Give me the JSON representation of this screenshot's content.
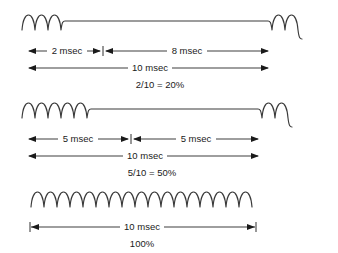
{
  "figure": {
    "background_color": "#ffffff",
    "wave_color": "#3a3a3a",
    "line_color": "#1a1a1a",
    "width": 338,
    "height": 253
  },
  "rows": [
    {
      "id": "row-20-percent",
      "on_label": "2 msec",
      "off_label": "8 msec",
      "total_label": "10 msec",
      "duty_label": "2/10 = 20%",
      "duty_fraction": "2/10",
      "duty_percent": "20%",
      "on_msec": 2,
      "off_msec": 8,
      "total_msec": 10,
      "cycles_on": 3
    },
    {
      "id": "row-50-percent",
      "on_label": "5 msec",
      "off_label": "5 msec",
      "total_label": "10 msec",
      "duty_label": "5/10 = 50%",
      "duty_fraction": "5/10",
      "duty_percent": "50%",
      "on_msec": 5,
      "off_msec": 5,
      "total_msec": 10,
      "cycles_on": 4
    },
    {
      "id": "row-100-percent",
      "on_label": "",
      "off_label": "",
      "total_label": "10 msec",
      "duty_label": "100%",
      "duty_fraction": "",
      "duty_percent": "100%",
      "on_msec": 10,
      "off_msec": 0,
      "total_msec": 10,
      "cycles_on": 7
    }
  ]
}
